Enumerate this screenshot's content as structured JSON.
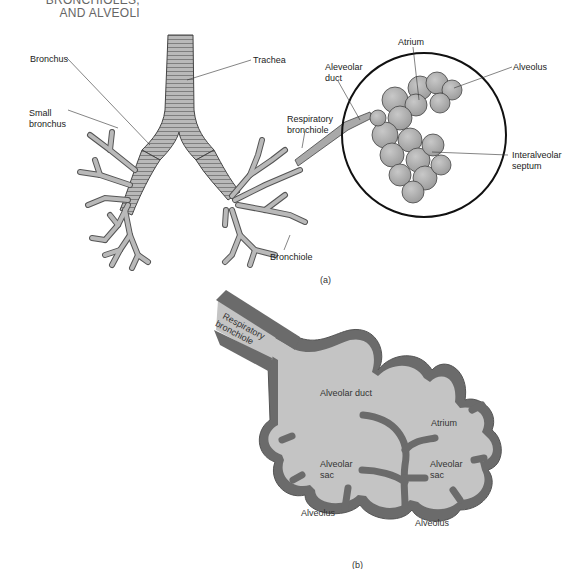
{
  "heading": {
    "line1": "BRONCHIOLES,",
    "line2": "AND ALVEOLI"
  },
  "figure_a": {
    "caption": "(a)",
    "labels": {
      "bronchus": "Bronchus",
      "trachea": "Trachea",
      "small_bronchus_1": "Small",
      "small_bronchus_2": "bronchus",
      "respiratory_bronchiole_1": "Respiratory",
      "respiratory_bronchiole_2": "bronchiole",
      "alveolar_duct_1": "Aleveolar",
      "alveolar_duct_2": "duct",
      "atrium": "Atrium",
      "alveolus": "Alveolus",
      "interalveolar_septum_1": "Interalveolar",
      "interalveolar_septum_2": "septum",
      "bronchiole": "Bronchiole"
    }
  },
  "figure_b": {
    "caption": "(b)",
    "labels": {
      "respiratory_bronchiole_1": "Respiratory",
      "respiratory_bronchiole_2": "bronchiole",
      "alveolar_duct": "Alveolar duct",
      "atrium": "Atrium",
      "alveolar_sac_left_1": "Alveolar",
      "alveolar_sac_left_2": "sac",
      "alveolar_sac_right_1": "Alveolar",
      "alveolar_sac_right_2": "sac",
      "alveolus_left": "Alveolus",
      "alveolus_right": "Alveolus"
    },
    "colors": {
      "wall": "#6b6b6b",
      "lumen": "#c4c4c4"
    }
  }
}
